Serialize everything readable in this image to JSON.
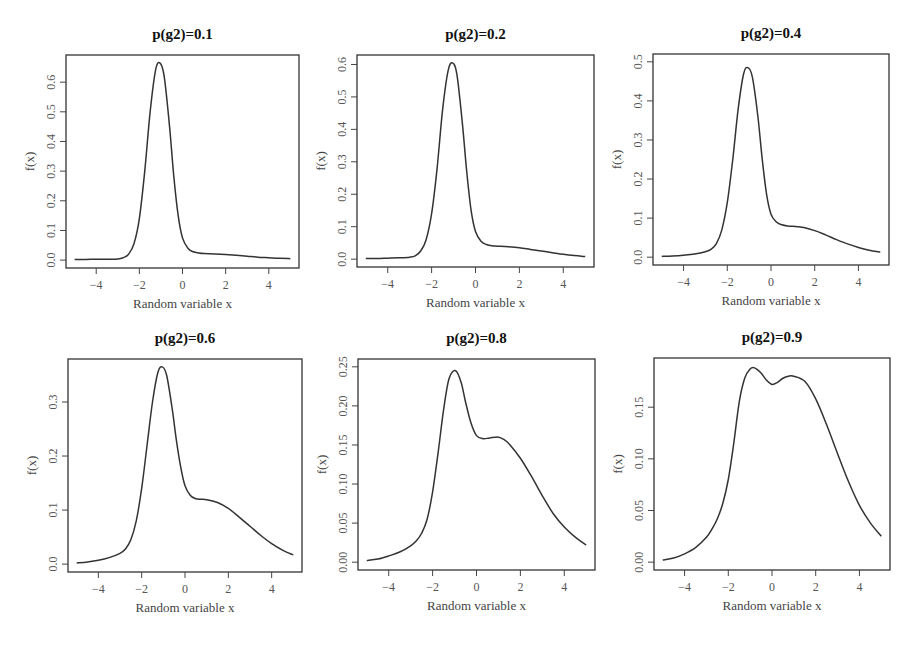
{
  "chart_data": [
    {
      "type": "line",
      "title": "p(g2)=0.1",
      "xlabel": "Random variable x",
      "ylabel": "f(x)",
      "xlim": [
        -5,
        5
      ],
      "ylim": [
        0,
        0.665
      ],
      "xticks": [
        -4,
        -2,
        0,
        2,
        4
      ],
      "xtick_labels": [
        "−4",
        "−2",
        "0",
        "2",
        "4"
      ],
      "yticks": [
        0.0,
        0.1,
        0.2,
        0.3,
        0.4,
        0.5,
        0.6
      ],
      "ytick_labels": [
        "0.0",
        "0.1",
        "0.2",
        "0.3",
        "0.4",
        "0.5",
        "0.6"
      ],
      "grid": false,
      "series": [
        {
          "name": "f(x)",
          "x": [
            -5,
            -4.5,
            -4,
            -3.5,
            -3,
            -2.75,
            -2.5,
            -2.25,
            -2,
            -1.75,
            -1.5,
            -1.25,
            -1.05,
            -0.85,
            -0.6,
            -0.4,
            -0.2,
            0,
            0.25,
            0.5,
            0.75,
            1,
            1.5,
            2,
            2.5,
            3,
            3.5,
            4,
            4.5,
            5
          ],
          "y": [
            0.002,
            0.002,
            0.003,
            0.003,
            0.004,
            0.008,
            0.02,
            0.055,
            0.14,
            0.3,
            0.5,
            0.64,
            0.665,
            0.62,
            0.45,
            0.28,
            0.15,
            0.075,
            0.04,
            0.028,
            0.024,
            0.022,
            0.021,
            0.019,
            0.016,
            0.013,
            0.01,
            0.008,
            0.006,
            0.005
          ]
        }
      ]
    },
    {
      "type": "line",
      "title": "p(g2)=0.2",
      "xlabel": "Random variable x",
      "ylabel": "f(x)",
      "xlim": [
        -5,
        5
      ],
      "ylim": [
        0,
        0.605
      ],
      "xticks": [
        -4,
        -2,
        0,
        2,
        4
      ],
      "xtick_labels": [
        "−4",
        "−2",
        "0",
        "2",
        "4"
      ],
      "yticks": [
        0.0,
        0.1,
        0.2,
        0.3,
        0.4,
        0.5,
        0.6
      ],
      "ytick_labels": [
        "0.0",
        "0.1",
        "0.2",
        "0.3",
        "0.4",
        "0.5",
        "0.6"
      ],
      "grid": false,
      "series": [
        {
          "name": "f(x)",
          "x": [
            -5,
            -4.5,
            -4,
            -3.5,
            -3,
            -2.75,
            -2.5,
            -2.25,
            -2,
            -1.75,
            -1.5,
            -1.25,
            -1.05,
            -0.85,
            -0.6,
            -0.4,
            -0.2,
            0,
            0.25,
            0.5,
            0.75,
            1,
            1.5,
            2,
            2.5,
            3,
            3.5,
            4,
            4.5,
            5
          ],
          "y": [
            0.002,
            0.002,
            0.003,
            0.004,
            0.006,
            0.01,
            0.025,
            0.06,
            0.14,
            0.28,
            0.46,
            0.58,
            0.605,
            0.57,
            0.42,
            0.27,
            0.15,
            0.085,
            0.055,
            0.045,
            0.041,
            0.04,
            0.038,
            0.035,
            0.03,
            0.025,
            0.02,
            0.015,
            0.011,
            0.008
          ]
        }
      ]
    },
    {
      "type": "line",
      "title": "p(g2)=0.4",
      "xlabel": "Random variable x",
      "ylabel": "f(x)",
      "xlim": [
        -5,
        5
      ],
      "ylim": [
        0,
        0.5
      ],
      "xticks": [
        -4,
        -2,
        0,
        2,
        4
      ],
      "xtick_labels": [
        "−4",
        "−2",
        "0",
        "2",
        "4"
      ],
      "yticks": [
        0.0,
        0.1,
        0.2,
        0.3,
        0.4,
        0.5
      ],
      "ytick_labels": [
        "0.0",
        "0.1",
        "0.2",
        "0.3",
        "0.4",
        "0.5"
      ],
      "grid": false,
      "series": [
        {
          "name": "f(x)",
          "x": [
            -5,
            -4.5,
            -4,
            -3.5,
            -3,
            -2.75,
            -2.5,
            -2.25,
            -2,
            -1.75,
            -1.5,
            -1.25,
            -1.05,
            -0.85,
            -0.6,
            -0.4,
            -0.2,
            0,
            0.25,
            0.5,
            0.75,
            1,
            1.5,
            2,
            2.5,
            3,
            3.5,
            4,
            4.5,
            5
          ],
          "y": [
            0.002,
            0.003,
            0.005,
            0.008,
            0.014,
            0.02,
            0.035,
            0.07,
            0.14,
            0.25,
            0.38,
            0.47,
            0.485,
            0.46,
            0.36,
            0.25,
            0.16,
            0.11,
            0.09,
            0.083,
            0.08,
            0.079,
            0.076,
            0.068,
            0.057,
            0.045,
            0.034,
            0.025,
            0.018,
            0.013
          ]
        }
      ]
    },
    {
      "type": "line",
      "title": "p(g2)=0.6",
      "xlabel": "Random variable x",
      "ylabel": "f(x)",
      "xlim": [
        -5,
        5
      ],
      "ylim": [
        0,
        0.365
      ],
      "xticks": [
        -4,
        -2,
        0,
        2,
        4
      ],
      "xtick_labels": [
        "−4",
        "−2",
        "0",
        "2",
        "4"
      ],
      "yticks": [
        0.0,
        0.1,
        0.2,
        0.3
      ],
      "ytick_labels": [
        "0.0",
        "0.1",
        "0.2",
        "0.3"
      ],
      "grid": false,
      "series": [
        {
          "name": "f(x)",
          "x": [
            -5,
            -4.5,
            -4,
            -3.5,
            -3,
            -2.75,
            -2.5,
            -2.25,
            -2,
            -1.75,
            -1.5,
            -1.25,
            -1.05,
            -0.85,
            -0.6,
            -0.4,
            -0.2,
            0,
            0.25,
            0.5,
            0.75,
            1,
            1.5,
            2,
            2.5,
            3,
            3.5,
            4,
            4.5,
            5
          ],
          "y": [
            0.002,
            0.004,
            0.007,
            0.012,
            0.02,
            0.028,
            0.045,
            0.08,
            0.14,
            0.22,
            0.3,
            0.355,
            0.365,
            0.35,
            0.29,
            0.23,
            0.18,
            0.145,
            0.127,
            0.121,
            0.12,
            0.119,
            0.114,
            0.103,
            0.087,
            0.07,
            0.053,
            0.038,
            0.026,
            0.017
          ]
        }
      ]
    },
    {
      "type": "line",
      "title": "p(g2)=0.8",
      "xlabel": "Random variable x",
      "ylabel": "f(x)",
      "xlim": [
        -5,
        5
      ],
      "ylim": [
        0,
        0.25
      ],
      "xticks": [
        -4,
        -2,
        0,
        2,
        4
      ],
      "xtick_labels": [
        "−4",
        "−2",
        "0",
        "2",
        "4"
      ],
      "yticks": [
        0.0,
        0.05,
        0.1,
        0.15,
        0.2,
        0.25
      ],
      "ytick_labels": [
        "0.00",
        "0.05",
        "0.10",
        "0.15",
        "0.20",
        "0.25"
      ],
      "grid": false,
      "series": [
        {
          "name": "f(x)",
          "x": [
            -5,
            -4.5,
            -4,
            -3.5,
            -3,
            -2.75,
            -2.5,
            -2.25,
            -2,
            -1.75,
            -1.5,
            -1.25,
            -0.95,
            -0.7,
            -0.5,
            -0.25,
            0,
            0.3,
            0.6,
            1,
            1.25,
            1.5,
            2,
            2.5,
            3,
            3.5,
            4,
            4.5,
            5
          ],
          "y": [
            0.002,
            0.004,
            0.008,
            0.013,
            0.021,
            0.027,
            0.037,
            0.055,
            0.09,
            0.14,
            0.195,
            0.235,
            0.245,
            0.23,
            0.205,
            0.178,
            0.162,
            0.158,
            0.159,
            0.16,
            0.157,
            0.151,
            0.133,
            0.11,
            0.085,
            0.062,
            0.045,
            0.032,
            0.022
          ]
        }
      ]
    },
    {
      "type": "line",
      "title": "p(g2)=0.9",
      "xlabel": "Random variable x",
      "ylabel": "f(x)",
      "xlim": [
        -5,
        5
      ],
      "ylim": [
        0,
        0.19
      ],
      "xticks": [
        -4,
        -2,
        0,
        2,
        4
      ],
      "xtick_labels": [
        "−4",
        "−2",
        "0",
        "2",
        "4"
      ],
      "yticks": [
        0.0,
        0.05,
        0.1,
        0.15
      ],
      "ytick_labels": [
        "0.00",
        "0.05",
        "0.10",
        "0.15"
      ],
      "grid": false,
      "series": [
        {
          "name": "f(x)",
          "x": [
            -5,
            -4.5,
            -4,
            -3.5,
            -3,
            -2.75,
            -2.5,
            -2.25,
            -2,
            -1.75,
            -1.5,
            -1.25,
            -1,
            -0.8,
            -0.5,
            -0.25,
            0,
            0.25,
            0.5,
            0.75,
            1,
            1.5,
            2,
            2.5,
            3,
            3.5,
            4,
            4.5,
            5
          ],
          "y": [
            0.002,
            0.004,
            0.008,
            0.014,
            0.024,
            0.032,
            0.042,
            0.057,
            0.08,
            0.115,
            0.155,
            0.178,
            0.187,
            0.188,
            0.183,
            0.176,
            0.172,
            0.174,
            0.178,
            0.18,
            0.18,
            0.175,
            0.158,
            0.133,
            0.105,
            0.078,
            0.055,
            0.038,
            0.025
          ]
        }
      ]
    }
  ]
}
